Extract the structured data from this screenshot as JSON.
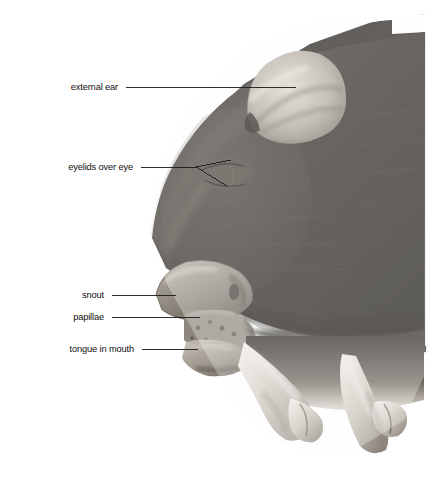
{
  "figure": {
    "kind": "photograph",
    "alt": "Black and white photograph of a dark-haired fetal pig head seen in profile, facing left, with two pale forelimbs crossing at the lower right. Five leader lines point from printed labels at the left to anatomical structures.",
    "background_color": "#ffffff",
    "photo_tone_dark": "#2a2724",
    "photo_tone_mid": "#7d7873",
    "photo_tone_light": "#cfc9c2",
    "photo_bounds": {
      "x": 148,
      "y": 16,
      "width": 278,
      "height": 440
    }
  },
  "annotations": [
    {
      "id": "external-ear",
      "text": "external ear",
      "label_x": 118,
      "label_y": 87,
      "line": {
        "type": "straight",
        "x1": 126,
        "y1": 87,
        "x2": 296,
        "y2": 87
      }
    },
    {
      "id": "eyelids-over-eye",
      "text": "eyelids over eye",
      "label_x": 133,
      "label_y": 167,
      "line": {
        "type": "forked",
        "x1": 141,
        "y1": 167,
        "fork_x": 196,
        "fork_y": 167,
        "branch_a_x": 231,
        "branch_a_y": 160,
        "branch_b_x": 227,
        "branch_b_y": 186
      }
    },
    {
      "id": "snout",
      "text": "snout",
      "label_x": 104,
      "label_y": 295,
      "line": {
        "type": "straight",
        "x1": 112,
        "y1": 295,
        "x2": 176,
        "y2": 295
      }
    },
    {
      "id": "papillae",
      "text": "papillae",
      "label_x": 104,
      "label_y": 317,
      "line": {
        "type": "straight",
        "x1": 112,
        "y1": 317,
        "x2": 200,
        "y2": 317
      }
    },
    {
      "id": "tongue-in-mouth",
      "text": "tongue in mouth",
      "label_x": 134,
      "label_y": 349,
      "line": {
        "type": "straight",
        "x1": 142,
        "y1": 349,
        "x2": 198,
        "y2": 349
      }
    }
  ],
  "leader_line": {
    "color": "#1a1a1a",
    "width": 0.9
  }
}
